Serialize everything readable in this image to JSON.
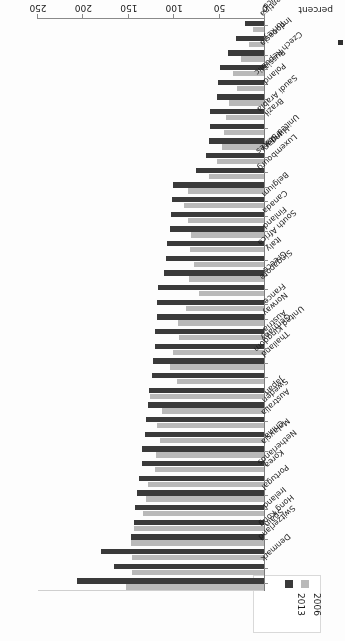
{
  "chart": {
    "type": "bar",
    "orientation": "horizontal",
    "rotation_note": "figure printed upside-down on the page",
    "xlabel": "percent",
    "ylabel": "",
    "title": "",
    "xlim": [
      0,
      250
    ],
    "xticks": [
      "0",
      "50",
      "100",
      "150",
      "200",
      "250"
    ],
    "grid": false,
    "legend_position": "top-left",
    "colors": {
      "series_2006": "#b9b9b9",
      "series_2013": "#3a3a3a",
      "axis": "#7d7d7d",
      "text": "#1d1d1d",
      "background": "#fdfdfd"
    }
  },
  "legend": {
    "entries": [
      {
        "label": "2006",
        "color": "#b9b9b9"
      },
      {
        "label": "2013",
        "color": "#3a3a3a"
      }
    ]
  },
  "axis": {
    "value_axis_title": "percent",
    "ticks": [
      {
        "label": "0",
        "value": 0
      },
      {
        "label": "50",
        "value": 50
      },
      {
        "label": "100",
        "value": 100
      },
      {
        "label": "150",
        "value": 150
      },
      {
        "label": "200",
        "value": 200
      },
      {
        "label": "250",
        "value": 250
      }
    ]
  },
  "chart_data": {
    "type": "bar",
    "orientation": "horizontal",
    "title": "",
    "xlabel": "percent",
    "ylabel": "",
    "xlim": [
      0,
      250
    ],
    "grid": false,
    "legend_position": "top-left",
    "categories": [
      "Denmark",
      "Switzerland",
      "Hong Kong",
      "Spain",
      "Ireland",
      "Portugal",
      "Netherlands",
      "Korea",
      "Malaysia",
      "China",
      "Australia",
      "Sweden",
      "Japan",
      "United Kingdom",
      "Thailand",
      "Germany",
      "Austria",
      "Norway",
      "France",
      "Singapore",
      "Greece",
      "South Africa",
      "Italy",
      "Finland",
      "Canada",
      "Belgium",
      "Luxembourg",
      "United States",
      "Hungary",
      "India",
      "Saudi Arabia",
      "Brazil",
      "Czech Republic",
      "Poland",
      "Russia",
      "Indonesia",
      "Turkey",
      "Argentina",
      "Mexico"
    ],
    "series": [
      {
        "name": "2006",
        "color": "#b9b9b9",
        "values": [
          152,
          145,
          145,
          146,
          143,
          133,
          130,
          128,
          120,
          119,
          114,
          118,
          112,
          125,
          96,
          103,
          100,
          94,
          95,
          86,
          72,
          83,
          77,
          82,
          80,
          84,
          88,
          84,
          61,
          52,
          46,
          44,
          42,
          38,
          30,
          34,
          25,
          17,
          12
        ]
      },
      {
        "name": "2013",
        "color": "#3a3a3a",
        "values": [
          206,
          165,
          180,
          147,
          143,
          142,
          140,
          138,
          134,
          134,
          131,
          130,
          128,
          127,
          123,
          122,
          120,
          120,
          118,
          118,
          117,
          110,
          108,
          107,
          104,
          102,
          101,
          100,
          75,
          64,
          61,
          60,
          59,
          52,
          51,
          48,
          40,
          31,
          21
        ]
      }
    ]
  }
}
